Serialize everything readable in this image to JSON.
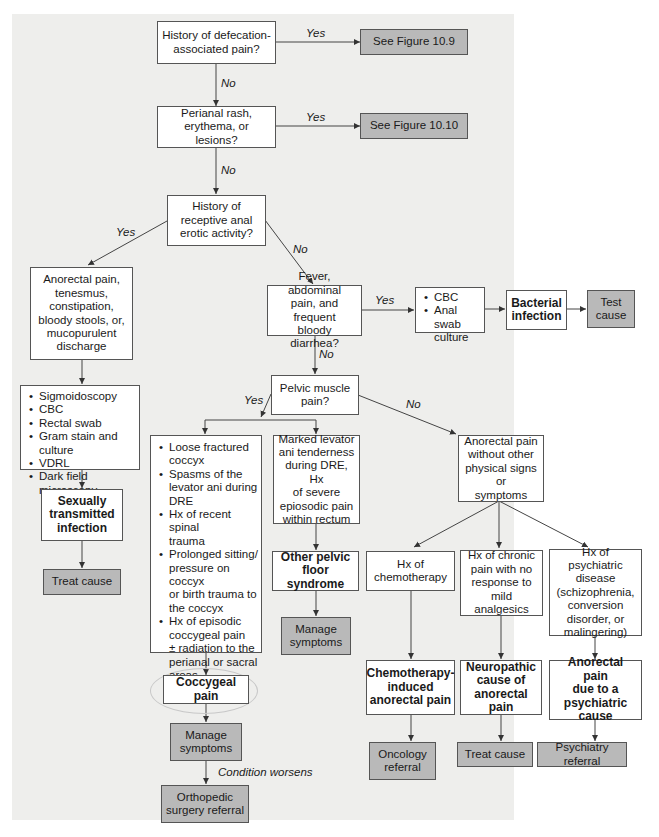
{
  "diagram": {
    "nodes": {
      "q1": "History of defecation-\nassociated pain?",
      "r1": "See Figure 10.9",
      "q2": "Perianal rash,\nerythema, or lesions?",
      "r2": "See Figure 10.10",
      "q3": "History of\nreceptive anal\nerotic activity?",
      "sx_left": "Anorectal pain,\ntenesmus,\nconstipation,\nbloody stools, or,\nmucopurulent\ndischarge",
      "tests_left": [
        "Sigmoidoscopy",
        "CBC",
        "Rectal swab",
        "Gram stain and culture",
        "VDRL",
        "Dark field microscopy"
      ],
      "sti": "Sexually\ntransmitted\ninfection",
      "sti_treat": "Treat cause",
      "q4": "Fever, abdominal\npain, and frequent\nbloody diarrhea?",
      "tests_right": [
        "CBC",
        "Anal swab\nculture"
      ],
      "bacterial": "Bacterial\ninfection",
      "test_cause": "Test\ncause",
      "q5": "Pelvic muscle\npain?",
      "coccyx_signs": [
        "Loose fractured\ncoccyx",
        "Spasms of the\nlevator ani during\nDRE",
        "Hx of recent spinal\ntrauma",
        "Prolonged sitting/\npressure on coccyx\nor birth trauma to\nthe coccyx",
        "Hx of episodic\ncoccygeal pain\n± radiation to the\nperianal or sacral\nareas"
      ],
      "coccygeal_pain": "Coccygeal pain",
      "coccyx_manage": "Manage\nsymptoms",
      "ortho": "Orthopedic\nsurgery referral",
      "levator": "Marked levator\nani tenderness\nduring DRE, Hx\nof severe\nepiosodic pain\nwithin rectum",
      "pelvic_floor": "Other pelvic\nfloor syndrome",
      "pelvic_manage": "Manage\nsymptoms",
      "no_signs": "Anorectal pain\nwithout other\nphysical signs or\nsymptoms",
      "chemo_hx": "Hx of\nchemotherapy",
      "chronic_hx": "Hx of chronic\npain with no\nresponse to mild\nanalgesics",
      "psych_hx": "Hx of psychiatric\ndisease\n(schizophrenia,\nconversion\ndisorder, or\nmalingering)",
      "chemo_dx": "Chemotherapy-\ninduced\nanorectal pain",
      "neuro_dx": "Neuropathic\ncause of\nanorectal pain",
      "psych_dx": "Anorectal pain\ndue to a\npsychiatric\ncause",
      "oncology": "Oncology\nreferral",
      "neuro_treat": "Treat cause",
      "psych_ref": "Psychiatry referral"
    },
    "edge_labels": {
      "yes": "Yes",
      "no": "No",
      "worsens": "Condition worsens"
    },
    "colors": {
      "background": "#eeeeec",
      "terminal_fill": "#b9b9b9",
      "box_fill": "#ffffff",
      "line": "#444444"
    }
  }
}
